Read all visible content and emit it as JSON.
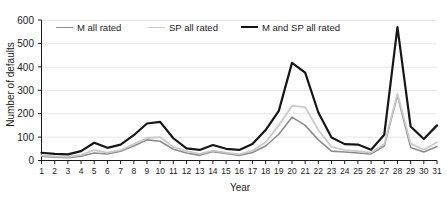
{
  "chart_data": {
    "type": "line",
    "title": "",
    "xlabel": "Year",
    "ylabel": "Number of defaults",
    "xlim": [
      1,
      31
    ],
    "ylim": [
      0,
      600
    ],
    "ytick_labels": [
      "0",
      "100",
      "200",
      "300",
      "400",
      "500",
      "600"
    ],
    "ytick_values": [
      0,
      100,
      200,
      300,
      400,
      500,
      600
    ],
    "x": [
      1,
      2,
      3,
      4,
      5,
      6,
      7,
      8,
      9,
      10,
      11,
      12,
      13,
      14,
      15,
      16,
      17,
      18,
      19,
      20,
      21,
      22,
      23,
      24,
      25,
      26,
      27,
      28,
      29,
      30,
      31
    ],
    "xtick_labels": [
      "1",
      "2",
      "3",
      "4",
      "5",
      "6",
      "7",
      "8",
      "9",
      "10",
      "11",
      "12",
      "13",
      "14",
      "15",
      "16",
      "17",
      "18",
      "19",
      "20",
      "21",
      "22",
      "23",
      "24",
      "25",
      "26",
      "27",
      "28",
      "29",
      "30",
      "31"
    ],
    "grid": true,
    "grid_axis": "y",
    "legend_position": "top-left-inside",
    "series": [
      {
        "name": "M all rated",
        "color": "#8c8c8c",
        "width": 1.6,
        "values": [
          18,
          14,
          12,
          18,
          32,
          28,
          40,
          62,
          88,
          82,
          48,
          32,
          22,
          38,
          30,
          22,
          34,
          62,
          112,
          185,
          150,
          88,
          40,
          36,
          32,
          28,
          62,
          278,
          56,
          36,
          60
        ]
      },
      {
        "name": "SP all rated",
        "color": "#c9c9c9",
        "width": 1.8,
        "values": [
          22,
          18,
          16,
          24,
          44,
          34,
          44,
          70,
          96,
          100,
          58,
          40,
          28,
          42,
          34,
          26,
          42,
          78,
          150,
          233,
          228,
          130,
          58,
          44,
          40,
          34,
          70,
          285,
          72,
          46,
          78
        ]
      },
      {
        "name": "M and SP all rated",
        "color": "#161616",
        "width": 2.2,
        "values": [
          33,
          28,
          26,
          40,
          76,
          54,
          68,
          108,
          158,
          165,
          95,
          52,
          45,
          66,
          50,
          45,
          70,
          130,
          212,
          417,
          375,
          205,
          98,
          70,
          68,
          46,
          110,
          570,
          145,
          92,
          150
        ]
      }
    ]
  },
  "legend": {
    "items": [
      {
        "label": "M all rated"
      },
      {
        "label": "SP all rated"
      },
      {
        "label": "M and SP all rated"
      }
    ]
  }
}
